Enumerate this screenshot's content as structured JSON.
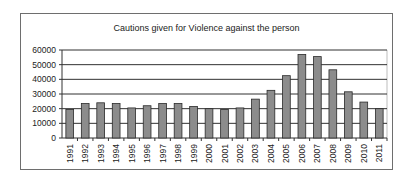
{
  "chart_data": {
    "type": "bar",
    "title": "Cautions given for Violence against the person",
    "xlabel": "",
    "ylabel": "",
    "ylim": [
      0,
      60000
    ],
    "yticks": [
      0,
      10000,
      20000,
      30000,
      40000,
      50000,
      60000
    ],
    "grid": true,
    "legend": "none",
    "bar_color": "#8c8c8c",
    "categories": [
      "1991",
      "1992",
      "1993",
      "1994",
      "1995",
      "1996",
      "1997",
      "1998",
      "1999",
      "2000",
      "2001",
      "2002",
      "2003",
      "2004",
      "2005",
      "2006",
      "2007",
      "2008",
      "2009",
      "2010",
      "2011"
    ],
    "values": [
      19500,
      23500,
      24000,
      23500,
      20500,
      22000,
      23500,
      23500,
      21500,
      20000,
      19500,
      20500,
      26500,
      32500,
      42500,
      57000,
      55500,
      46500,
      31500,
      24500,
      20000
    ]
  }
}
